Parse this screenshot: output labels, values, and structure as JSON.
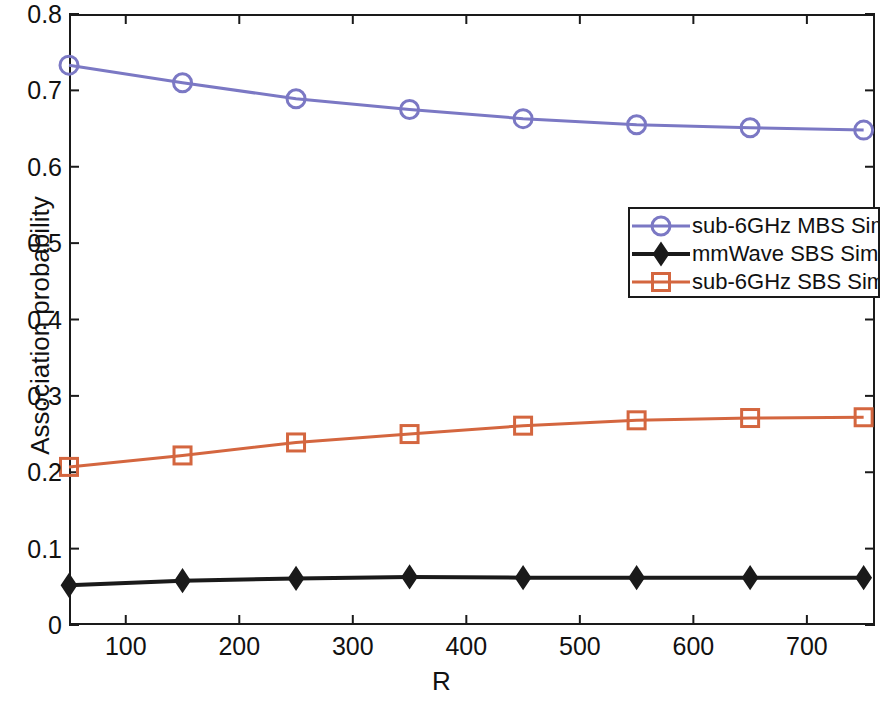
{
  "chart_data": {
    "type": "line",
    "title": "",
    "xlabel": "R",
    "ylabel": "Association probability",
    "xlim": [
      50,
      760
    ],
    "ylim": [
      0,
      0.8
    ],
    "xticks": [
      100,
      200,
      300,
      400,
      500,
      600,
      700
    ],
    "xtick_labels": [
      "100",
      "200",
      "300",
      "400",
      "500",
      "600",
      "700"
    ],
    "yticks": [
      0,
      0.1,
      0.2,
      0.3,
      0.4,
      0.5,
      0.6,
      0.7,
      0.8
    ],
    "ytick_labels": [
      "0",
      "0.1",
      "0.2",
      "0.3",
      "0.4",
      "0.5",
      "0.6",
      "0.7",
      "0.8"
    ],
    "grid": false,
    "legend_position": "upper right",
    "x": [
      50,
      150,
      250,
      350,
      450,
      550,
      650,
      750
    ],
    "series": [
      {
        "name": "sub-6GHz MBS Sim",
        "color": "#7b78c4",
        "marker": "circle",
        "values": [
          0.733,
          0.71,
          0.689,
          0.675,
          0.663,
          0.655,
          0.651,
          0.648
        ]
      },
      {
        "name": "mmWave SBS Sim",
        "color": "#1a1a1a",
        "marker": "diamond",
        "values": [
          0.052,
          0.058,
          0.061,
          0.063,
          0.062,
          0.062,
          0.062,
          0.062
        ]
      },
      {
        "name": "sub-6GHz SBS Sim",
        "color": "#d4663f",
        "marker": "square",
        "values": [
          0.207,
          0.222,
          0.239,
          0.25,
          0.261,
          0.268,
          0.271,
          0.272
        ]
      }
    ]
  },
  "legend": {
    "entries": [
      {
        "label": "sub-6GHz MBS Sim"
      },
      {
        "label": "mmWave SBS Sim"
      },
      {
        "label": "sub-6GHz SBS Sim"
      }
    ]
  }
}
